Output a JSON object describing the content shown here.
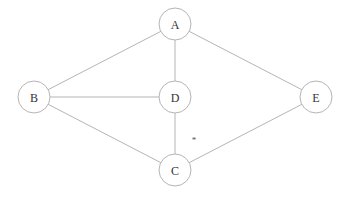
{
  "diagram": {
    "type": "undirected-graph",
    "nodes": [
      {
        "id": "A",
        "label": "A",
        "x": 175,
        "y": 24
      },
      {
        "id": "B",
        "label": "B",
        "x": 34,
        "y": 97
      },
      {
        "id": "D",
        "label": "D",
        "x": 175,
        "y": 97
      },
      {
        "id": "E",
        "label": "E",
        "x": 316,
        "y": 97
      },
      {
        "id": "C",
        "label": "C",
        "x": 175,
        "y": 170
      }
    ],
    "edges": [
      {
        "from": "A",
        "to": "B"
      },
      {
        "from": "A",
        "to": "D"
      },
      {
        "from": "A",
        "to": "E"
      },
      {
        "from": "B",
        "to": "D"
      },
      {
        "from": "B",
        "to": "C"
      },
      {
        "from": "D",
        "to": "C"
      },
      {
        "from": "C",
        "to": "E"
      }
    ],
    "annotation": {
      "text": "*",
      "x": 194,
      "y": 143
    }
  }
}
